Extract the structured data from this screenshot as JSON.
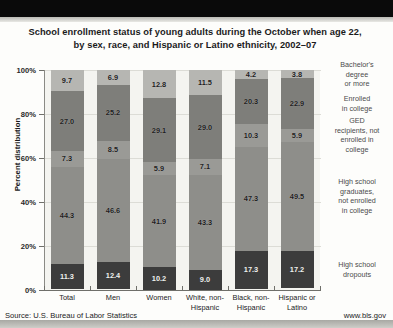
{
  "chart_data": {
    "type": "bar",
    "stacked": true,
    "title": "School enrollment status of young adults during the October when age 22, by sex, race, and Hispanic or Latino ethnicity, 2002–07",
    "title_line1": "School enrollment status of young adults during the October when age 22,",
    "title_line2": "by sex, race, and Hispanic or Latino ethnicity, 2002–07",
    "xlabel": "",
    "ylabel": "Percent distribution",
    "ylim": [
      0,
      100
    ],
    "ytick_labels": [
      "0%",
      "20%",
      "40%",
      "60%",
      "80%",
      "100%"
    ],
    "ytick_values": [
      0,
      20,
      40,
      60,
      80,
      100
    ],
    "grid": true,
    "legend_position": "right",
    "categories": [
      "Total",
      "Men",
      "Women",
      "White, non-Hispanic",
      "Black, non-Hispanic",
      "Hispanic or Latino"
    ],
    "category_lines": [
      [
        "Total"
      ],
      [
        "Men"
      ],
      [
        "Women"
      ],
      [
        "White, non-",
        "Hispanic"
      ],
      [
        "Black, non-",
        "Hispanic"
      ],
      [
        "Hispanic or",
        "Latino"
      ]
    ],
    "series": [
      {
        "name": "High school dropouts",
        "name_lines": [
          "High school",
          "dropouts"
        ],
        "color": "#3c3c3c",
        "values": [
          11.3,
          12.4,
          10.2,
          9.0,
          17.3,
          17.2
        ]
      },
      {
        "name": "High school graduates, not enrolled in college",
        "name_lines": [
          "High school",
          "graduates,",
          "not enrolled",
          "in college"
        ],
        "color": "#8e8e8a",
        "values": [
          44.3,
          46.6,
          41.9,
          43.3,
          47.3,
          49.5
        ]
      },
      {
        "name": "GED recipients, not enrolled in college",
        "name_lines": [
          "GED",
          "recipients, not",
          "enrolled in",
          "college"
        ],
        "color": "#9a9a96",
        "values": [
          7.3,
          8.5,
          5.9,
          7.1,
          10.3,
          5.9
        ]
      },
      {
        "name": "Enrolled in college",
        "name_lines": [
          "Enrolled",
          "in college"
        ],
        "color": "#7e7e7a",
        "values": [
          27.0,
          25.2,
          29.1,
          29.0,
          20.3,
          22.9
        ]
      },
      {
        "name": "Bachelor's degree or more",
        "name_lines": [
          "Bachelor's",
          "degree",
          "or more"
        ],
        "color": "#b6b6b2",
        "values": [
          9.7,
          6.9,
          12.8,
          11.5,
          4.2,
          3.8
        ]
      }
    ]
  },
  "footer": {
    "source": "Source: U.S. Bureau of Labor Statistics",
    "url": "www.bls.gov"
  }
}
